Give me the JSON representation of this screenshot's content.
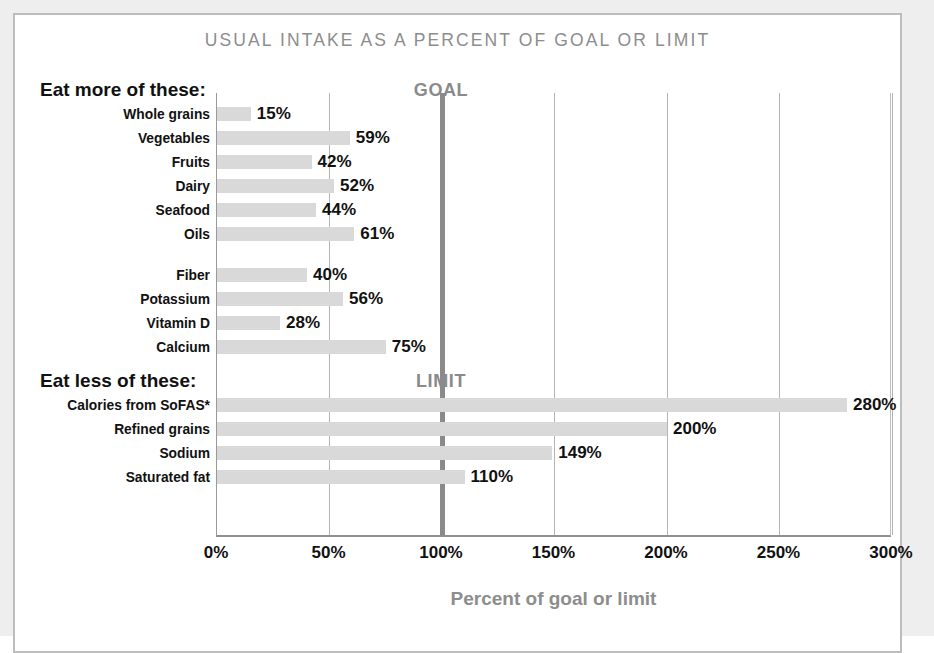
{
  "chart_data": {
    "type": "bar",
    "orientation": "horizontal",
    "title": "USUAL INTAKE AS A PERCENT OF GOAL OR LIMIT",
    "xlabel": "Percent of goal or limit",
    "ylabel": "",
    "xlim": [
      0,
      300
    ],
    "tick_labels": [
      "0%",
      "50%",
      "100%",
      "150%",
      "200%",
      "250%",
      "300%"
    ],
    "tick_values": [
      0,
      50,
      100,
      150,
      200,
      250,
      300
    ],
    "grid": true,
    "legend": "none",
    "reference_line": {
      "value": 100,
      "labels": [
        "GOAL",
        "LIMIT"
      ]
    },
    "groups": [
      {
        "heading": "Eat more of these:",
        "marker_label": "GOAL",
        "subgroups": [
          {
            "categories": [
              "Whole grains",
              "Vegetables",
              "Fruits",
              "Dairy",
              "Seafood",
              "Oils"
            ],
            "values": [
              15,
              59,
              42,
              52,
              44,
              61
            ],
            "value_labels": [
              "15%",
              "59%",
              "42%",
              "52%",
              "44%",
              "61%"
            ]
          },
          {
            "categories": [
              "Fiber",
              "Potassium",
              "Vitamin D",
              "Calcium"
            ],
            "values": [
              40,
              56,
              28,
              75
            ],
            "value_labels": [
              "40%",
              "56%",
              "28%",
              "75%"
            ]
          }
        ]
      },
      {
        "heading": "Eat less of these:",
        "marker_label": "LIMIT",
        "subgroups": [
          {
            "categories": [
              "Calories from SoFAS*",
              "Refined grains",
              "Sodium",
              "Saturated fat"
            ],
            "values": [
              280,
              200,
              149,
              110
            ],
            "value_labels": [
              "280%",
              "200%",
              "149%",
              "110%"
            ]
          }
        ]
      }
    ],
    "colors": {
      "bar": "#d9d9d9",
      "title": "#8d8d8d",
      "axis_title": "#8d8d8d",
      "reference_line": "#8a8a8a",
      "gridline": "#b4b4b4",
      "text": "#111111"
    }
  }
}
